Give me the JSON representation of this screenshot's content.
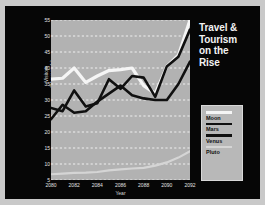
{
  "slide": {
    "title_lines": [
      "Travel &",
      "Tourism",
      "on the",
      "Rise"
    ],
    "title_text": "Travel & Tourism on the Rise",
    "background_color": "#060606",
    "frame_color": "#c9c9c9",
    "plot_background_color": "#b2b2b2",
    "gridline_color": "#f0f0f0"
  },
  "legend": {
    "position": "right",
    "entries": [
      {
        "label": "Moon",
        "color": "#f5f5f5"
      },
      {
        "label": "Mars",
        "color": "#101010"
      },
      {
        "label": "Venus",
        "color": "#101010"
      },
      {
        "label": "Pluto",
        "color": "#d5d5d5"
      }
    ]
  },
  "chart_data": {
    "type": "line",
    "title": "Travel & Tourism on the Rise",
    "xlabel": "Year",
    "ylabel_lines": [
      "Visitors",
      "(Thousands)"
    ],
    "ylabel": "Visitors (Thousands)",
    "grid": true,
    "grid_style": "dashed-horizontal",
    "legend_position": "right",
    "x": [
      2080,
      2081,
      2082,
      2083,
      2084,
      2085,
      2086,
      2087,
      2088,
      2089,
      2090,
      2091,
      2092
    ],
    "xtick_labels": [
      "2080",
      "2082",
      "2084",
      "2086",
      "2088",
      "2090",
      "2092"
    ],
    "xticks": [
      2080,
      2082,
      2084,
      2086,
      2088,
      2090,
      2092
    ],
    "xlim": [
      2080,
      2092
    ],
    "yticks": [
      5,
      10,
      15,
      20,
      25,
      30,
      35,
      40,
      45,
      50,
      55
    ],
    "ytick_labels": [
      "5",
      "10",
      "15",
      "20",
      "25",
      "30",
      "35",
      "40",
      "45",
      "50",
      "55"
    ],
    "ylim": [
      5,
      55
    ],
    "series": [
      {
        "name": "Moon",
        "color": "#f5f5f5",
        "values": [
          36.5,
          36.8,
          40.0,
          35.5,
          37.5,
          39.2,
          39.5,
          40.0,
          34.5,
          32.0,
          40.5,
          44.0,
          55.0
        ]
      },
      {
        "name": "Mars",
        "color": "#101010",
        "values": [
          27.5,
          26.5,
          33.0,
          28.0,
          29.0,
          36.5,
          33.5,
          37.5,
          37.0,
          31.0,
          40.5,
          43.5,
          52.0
        ]
      },
      {
        "name": "Venus",
        "color": "#101010",
        "values": [
          24.0,
          28.5,
          26.0,
          26.5,
          29.5,
          32.0,
          34.5,
          31.5,
          30.5,
          30.0,
          30.0,
          35.0,
          42.0
        ]
      },
      {
        "name": "Pluto",
        "color": "#d5d5d5",
        "values": [
          6.8,
          7.0,
          7.2,
          7.3,
          7.5,
          8.0,
          8.3,
          8.6,
          8.8,
          9.5,
          10.5,
          12.0,
          14.0
        ]
      }
    ]
  }
}
